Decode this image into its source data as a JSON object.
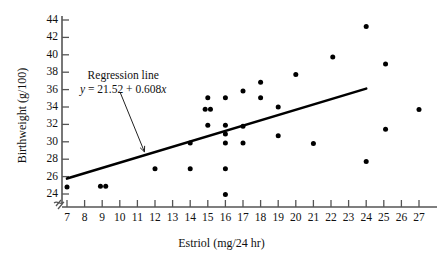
{
  "chart_data": {
    "type": "scatter",
    "title": "",
    "xlabel": "Estriol (mg/24 hr)",
    "ylabel": "Birthweight (g/100)",
    "xlim": [
      7,
      27
    ],
    "ylim": [
      23,
      44.6
    ],
    "grid": false,
    "legend": "none",
    "x_ticks": [
      7,
      8,
      9,
      10,
      11,
      12,
      13,
      14,
      15,
      16,
      17,
      18,
      19,
      20,
      21,
      22,
      23,
      24,
      25,
      26,
      27
    ],
    "y_ticks": [
      24,
      26,
      28,
      30,
      32,
      34,
      36,
      38,
      40,
      42,
      44
    ],
    "axis_break": true,
    "points": [
      {
        "x": 7.0,
        "y": 24.8
      },
      {
        "x": 8.9,
        "y": 24.9
      },
      {
        "x": 9.2,
        "y": 24.9
      },
      {
        "x": 12.0,
        "y": 26.9
      },
      {
        "x": 14.0,
        "y": 26.9
      },
      {
        "x": 14.0,
        "y": 29.85
      },
      {
        "x": 14.85,
        "y": 33.75
      },
      {
        "x": 15.0,
        "y": 35.05
      },
      {
        "x": 15.0,
        "y": 31.9
      },
      {
        "x": 15.15,
        "y": 33.75
      },
      {
        "x": 16.0,
        "y": 35.05
      },
      {
        "x": 16.0,
        "y": 31.9
      },
      {
        "x": 16.0,
        "y": 30.9
      },
      {
        "x": 16.0,
        "y": 29.85
      },
      {
        "x": 16.0,
        "y": 26.9
      },
      {
        "x": 16.0,
        "y": 23.95
      },
      {
        "x": 17.0,
        "y": 35.85
      },
      {
        "x": 17.0,
        "y": 31.8
      },
      {
        "x": 17.0,
        "y": 29.85
      },
      {
        "x": 18.0,
        "y": 36.85
      },
      {
        "x": 18.0,
        "y": 35.05
      },
      {
        "x": 19.0,
        "y": 34.0
      },
      {
        "x": 19.0,
        "y": 30.7
      },
      {
        "x": 20.0,
        "y": 37.75
      },
      {
        "x": 21.0,
        "y": 29.8
      },
      {
        "x": 22.1,
        "y": 39.75
      },
      {
        "x": 24.0,
        "y": 43.25
      },
      {
        "x": 24.0,
        "y": 27.75
      },
      {
        "x": 25.1,
        "y": 38.95
      },
      {
        "x": 25.1,
        "y": 31.45
      },
      {
        "x": 27.0,
        "y": 33.7
      }
    ],
    "regression_line": {
      "intercept": 21.52,
      "slope": 0.608,
      "x_start": 7.0,
      "x_end": 24.0
    },
    "annotation": {
      "line1": "Regression line",
      "equation_y": "y",
      "equation_rest": " = 21.52 + 0.608",
      "equation_x": "x",
      "arrow_target": {
        "x": 11.4,
        "y": 28.5
      }
    },
    "colors": {
      "point": "#000000",
      "line": "#000000",
      "axis": "#555555",
      "text": "#111111",
      "background": "#ffffff"
    }
  }
}
